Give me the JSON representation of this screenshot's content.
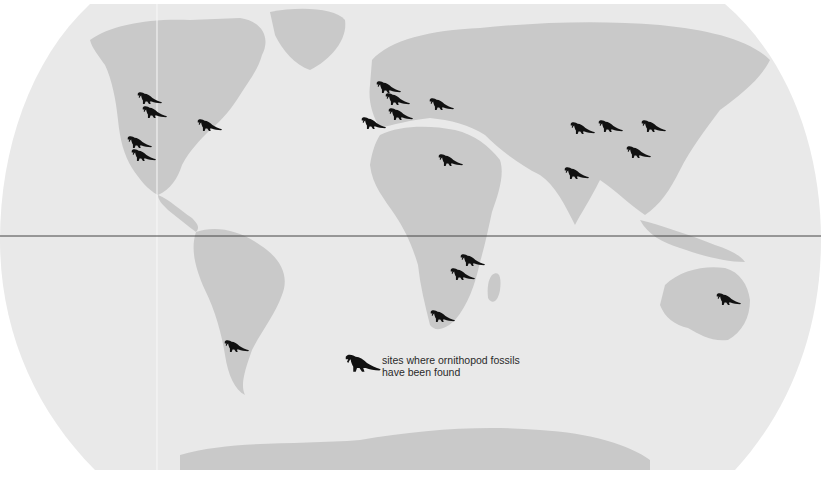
{
  "map": {
    "title": "Ornithopod fossil sites",
    "colors": {
      "ocean": "#e9e9e9",
      "land": "#c9c9c9",
      "equator": "#444444",
      "marker": "#111111",
      "background": "#ffffff"
    },
    "equator_label": "equator line",
    "legend": {
      "line1": "sites where ornithopod fossils",
      "line2": "have been found"
    },
    "sites": [
      {
        "region": "North America - Alberta",
        "x": 148,
        "y": 99
      },
      {
        "region": "North America - Montana",
        "x": 153,
        "y": 113
      },
      {
        "region": "North America - Eastern US",
        "x": 208,
        "y": 126
      },
      {
        "region": "North America - Utah",
        "x": 138,
        "y": 143
      },
      {
        "region": "North America - New Mexico",
        "x": 142,
        "y": 156
      },
      {
        "region": "Europe - England",
        "x": 387,
        "y": 88
      },
      {
        "region": "Europe - Belgium",
        "x": 396,
        "y": 100
      },
      {
        "region": "Europe - France",
        "x": 399,
        "y": 115
      },
      {
        "region": "Europe - Spain/Portugal",
        "x": 372,
        "y": 124
      },
      {
        "region": "Europe - Romania",
        "x": 440,
        "y": 105
      },
      {
        "region": "Africa - Niger",
        "x": 449,
        "y": 161
      },
      {
        "region": "Asia - Mongolia West",
        "x": 581,
        "y": 129
      },
      {
        "region": "Asia - Mongolia",
        "x": 609,
        "y": 127
      },
      {
        "region": "Asia - China North",
        "x": 652,
        "y": 127
      },
      {
        "region": "Asia - China",
        "x": 637,
        "y": 153
      },
      {
        "region": "Asia - India",
        "x": 575,
        "y": 174
      },
      {
        "region": "Africa - Tanzania",
        "x": 471,
        "y": 261
      },
      {
        "region": "Africa - Zimbabwe",
        "x": 461,
        "y": 275
      },
      {
        "region": "Africa - South Africa",
        "x": 441,
        "y": 317
      },
      {
        "region": "South America - Patagonia",
        "x": 235,
        "y": 347
      },
      {
        "region": "Australia - Queensland",
        "x": 727,
        "y": 300
      }
    ]
  }
}
